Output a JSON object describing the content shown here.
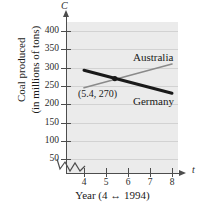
{
  "chart_data": {
    "type": "line",
    "title": "",
    "xlabel": "Year (4 ↔ 1994)",
    "ylabel_line1": "Coal produced",
    "ylabel_line2": "(in millions of tons)",
    "x_axis_symbol": "t",
    "y_axis_symbol": "C",
    "xlim": [
      4,
      8
    ],
    "ylim": [
      0,
      420
    ],
    "x_ticks": [
      4,
      5,
      6,
      7,
      8
    ],
    "y_ticks": [
      50,
      100,
      150,
      200,
      250,
      300,
      350,
      400
    ],
    "x_tick_labels": [
      "4",
      "5",
      "6",
      "7",
      "8"
    ],
    "y_tick_labels": [
      "50",
      "100",
      "150",
      "200",
      "250",
      "300",
      "350",
      "400"
    ],
    "grid": true,
    "axis_break": true,
    "legend": "inline-labels",
    "series": [
      {
        "name": "Australia",
        "color": "#8a8a8a",
        "width": 1.6,
        "x": [
          4,
          8
        ],
        "values": [
          245,
          310
        ]
      },
      {
        "name": "Germany",
        "color": "#1a1a1a",
        "width": 3.0,
        "x": [
          4,
          8
        ],
        "values": [
          293,
          230
        ]
      }
    ],
    "annotations": [
      {
        "text": "(5.4, 270)",
        "x": 5.4,
        "y": 270,
        "marker": true
      }
    ]
  },
  "labels": {
    "australia": "Australia",
    "germany": "Germany",
    "intersection": "(5.4, 270)"
  },
  "colors": {
    "plot_background": "#ebebeb",
    "gridline": "#d2d2d2",
    "axis": "#4d4d4d",
    "australia": "#8a8a8a",
    "germany": "#1a1a1a",
    "text": "#1a1a1a"
  }
}
